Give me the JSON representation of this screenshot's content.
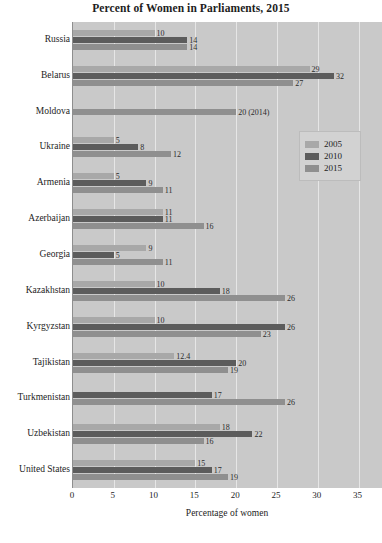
{
  "chart_data": {
    "type": "bar",
    "orientation": "horizontal",
    "title": "Percent of Women in Parliaments, 2015",
    "xlabel": "Percentage of women",
    "ylabel": "",
    "xlim": [
      0,
      38
    ],
    "xticks": [
      0,
      5,
      10,
      15,
      20,
      25,
      30,
      35
    ],
    "xtick_labels": [
      "0",
      "5",
      "10",
      "15",
      "20",
      "25",
      "30",
      "35"
    ],
    "grid": true,
    "legend_position": "upper-right",
    "legend": [
      "2005",
      "2010",
      "2015"
    ],
    "categories": [
      "Russia",
      "Belarus",
      "Moldova",
      "Ukraine",
      "Armenia",
      "Azerbaijan",
      "Georgia",
      "Kazakhstan",
      "Kyrgyzstan",
      "Tajikistan",
      "Turkmenistan",
      "Uzbekistan",
      "United States"
    ],
    "series": [
      {
        "name": "2005",
        "color": "#a8a8a8",
        "values": [
          10,
          29,
          null,
          5,
          5,
          11,
          9,
          10,
          10,
          12.4,
          null,
          18,
          15
        ],
        "labels": [
          "10",
          "29",
          "",
          "5",
          "5",
          "11",
          "9",
          "10",
          "10",
          "12.4",
          "",
          "18",
          "15"
        ]
      },
      {
        "name": "2010",
        "color": "#5c5c5c",
        "values": [
          14,
          32,
          null,
          8,
          9,
          11,
          5,
          18,
          26,
          20,
          17,
          22,
          17
        ],
        "labels": [
          "14",
          "32",
          "",
          "8",
          "9",
          "11",
          "5",
          "18",
          "26",
          "20",
          "17",
          "22",
          "17"
        ]
      },
      {
        "name": "2015",
        "color": "#8f8f8f",
        "values": [
          14,
          27,
          20,
          12,
          11,
          16,
          11,
          26,
          23,
          19,
          26,
          16,
          19
        ],
        "labels": [
          "14",
          "27",
          "20 (2014)",
          "12",
          "11",
          "16",
          "11",
          "26",
          "23",
          "19",
          "26",
          "16",
          "19"
        ]
      }
    ]
  },
  "colors": {
    "plot_background": "#c9c9c9",
    "gridline": "#e6e6e6",
    "legend_background": "#d2d2d2",
    "text": "#1d1d1d"
  }
}
